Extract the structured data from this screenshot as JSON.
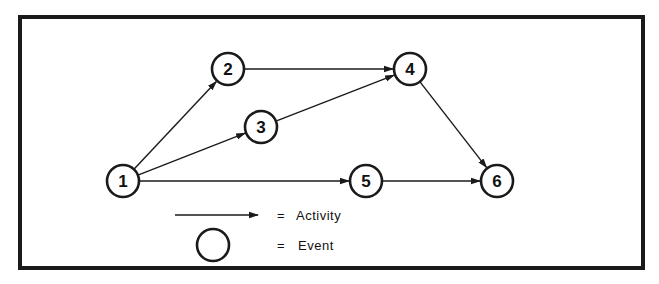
{
  "diagram": {
    "type": "activity-on-arrow network",
    "colors": {
      "stroke": "#1a1a1a",
      "background": "#ffffff"
    },
    "nodes": [
      {
        "id": "1",
        "label": "1",
        "x": 123,
        "y": 181
      },
      {
        "id": "2",
        "label": "2",
        "x": 228,
        "y": 69
      },
      {
        "id": "3",
        "label": "3",
        "x": 261,
        "y": 127
      },
      {
        "id": "4",
        "label": "4",
        "x": 410,
        "y": 69
      },
      {
        "id": "5",
        "label": "5",
        "x": 366,
        "y": 181
      },
      {
        "id": "6",
        "label": "6",
        "x": 497,
        "y": 181
      }
    ],
    "edges": [
      {
        "from": "1",
        "to": "2"
      },
      {
        "from": "1",
        "to": "3"
      },
      {
        "from": "1",
        "to": "5"
      },
      {
        "from": "2",
        "to": "4"
      },
      {
        "from": "3",
        "to": "4"
      },
      {
        "from": "4",
        "to": "6"
      },
      {
        "from": "5",
        "to": "6"
      }
    ]
  },
  "legend": {
    "activity": {
      "symbol": "=",
      "label": "Activity"
    },
    "event": {
      "symbol": "=",
      "label": "Event"
    }
  }
}
